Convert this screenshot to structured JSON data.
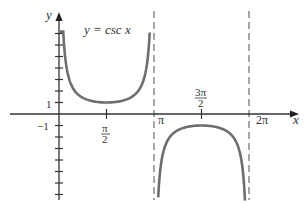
{
  "chart_data": {
    "type": "line",
    "title": "y = csc x",
    "xlabel": "x",
    "ylabel": "y",
    "x_ticks": [
      {
        "value": 1.5708,
        "label_num": "π",
        "label_den": "2"
      },
      {
        "value": 3.1416,
        "label": "π"
      },
      {
        "value": 4.7124,
        "label_num": "3π",
        "label_den": "2"
      },
      {
        "value": 6.2832,
        "label": "2π"
      }
    ],
    "y_ticks": [
      -7,
      -6,
      -5,
      -4,
      -3,
      -2,
      -1,
      1,
      2,
      3,
      4,
      5,
      6,
      7
    ],
    "y_tick_labels": [
      {
        "value": 1,
        "label": "1"
      },
      {
        "value": -1,
        "label": "−1"
      }
    ],
    "xlim": [
      -0.3,
      7.6
    ],
    "ylim": [
      -7.3,
      8.8
    ],
    "asymptotes": [
      3.1416,
      6.2832
    ],
    "series": [
      {
        "name": "csc x on (0, π)",
        "x_range": [
          0.14,
          3.0
        ],
        "values_note": "positive branch, minimum 1 at π/2"
      },
      {
        "name": "csc x on (π, 2π)",
        "x_range": [
          3.28,
          6.15
        ],
        "values_note": "negative branch, maximum -1 at 3π/2"
      }
    ],
    "colors": {
      "curve": "#6e6e6e",
      "axis": "#333333",
      "asymptote": "#777777"
    }
  },
  "labels": {
    "title": "y = csc x",
    "x_axis": "x",
    "y_axis": "y",
    "y_one": "1",
    "y_neg_one": "−1",
    "pi_half_num": "π",
    "pi_half_den": "2",
    "pi": "π",
    "three_pi_half_num": "3π",
    "three_pi_half_den": "2",
    "two_pi": "2π"
  }
}
